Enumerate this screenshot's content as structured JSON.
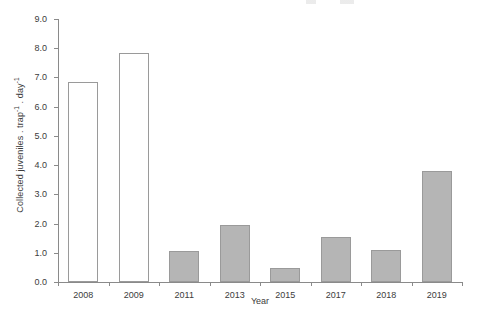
{
  "figure": {
    "ylabel_text": "Collected juveniles . trap",
    "ylabel_sup1": "-1",
    "ylabel_mid": " . day",
    "ylabel_sup2": "-1",
    "xlabel": "Year"
  },
  "chart_data": {
    "type": "bar",
    "title": "",
    "xlabel": "Year",
    "ylabel": "Collected juveniles . trap-1 . day-1",
    "categories": [
      "2008",
      "2009",
      "2011",
      "2013",
      "2015",
      "2017",
      "2018",
      "2019"
    ],
    "values": [
      6.85,
      7.85,
      1.05,
      1.95,
      0.48,
      1.55,
      1.1,
      3.8
    ],
    "bar_styles": [
      "open",
      "open",
      "filled",
      "filled",
      "filled",
      "filled",
      "filled",
      "filled"
    ],
    "bar_fill_open": "#ffffff",
    "bar_fill_filled": "#b5b5b5",
    "bar_edge_color": "#9a9a9a",
    "axis_color": "#8a8a8a",
    "ylim": [
      0.0,
      9.0
    ],
    "yticks": [
      0.0,
      1.0,
      2.0,
      3.0,
      4.0,
      5.0,
      6.0,
      7.0,
      8.0,
      9.0
    ],
    "ytick_labels": [
      "0.0",
      "1.0",
      "2.0",
      "3.0",
      "4.0",
      "5.0",
      "6.0",
      "7.0",
      "8.0",
      "9.0"
    ],
    "grid": false,
    "legend": null,
    "legend_position": "none"
  }
}
